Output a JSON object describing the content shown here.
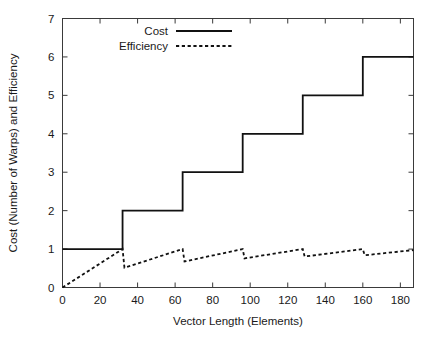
{
  "chart_data": {
    "type": "line",
    "title": "",
    "xlabel": "Vector Length (Elements)",
    "ylabel": "Cost (Number of Warps) and Efficiency",
    "xlim": [
      0,
      187
    ],
    "ylim": [
      0,
      7
    ],
    "xticks": [
      0,
      20,
      40,
      60,
      80,
      100,
      120,
      140,
      160,
      180
    ],
    "xticklabels": [
      "0",
      "20",
      "40",
      "60",
      "80",
      "100",
      "120",
      "140",
      "160",
      "180"
    ],
    "yticks": [
      0,
      1,
      2,
      3,
      4,
      5,
      6,
      7
    ],
    "yticklabels": [
      "0",
      "1",
      "2",
      "3",
      "4",
      "5",
      "6",
      "7"
    ],
    "grid": false,
    "legend_position": "top-center",
    "warp_size": 32,
    "series": [
      {
        "name": "Cost",
        "style": "solid",
        "color": "#111111",
        "description": "Step function: number of warps = ceil(vector length / 32)",
        "points": [
          [
            0,
            1
          ],
          [
            32,
            1
          ],
          [
            32,
            2
          ],
          [
            64,
            2
          ],
          [
            64,
            3
          ],
          [
            96,
            3
          ],
          [
            96,
            4
          ],
          [
            128,
            4
          ],
          [
            128,
            5
          ],
          [
            160,
            5
          ],
          [
            160,
            6
          ],
          [
            187,
            6
          ]
        ]
      },
      {
        "name": "Efficiency",
        "style": "dashed",
        "color": "#111111",
        "description": "Sawtooth: efficiency = vector length / (32 * ceil(vector length / 32))",
        "points": [
          [
            0,
            0.0
          ],
          [
            32,
            1.0
          ],
          [
            33,
            0.516
          ],
          [
            64,
            1.0
          ],
          [
            65,
            0.677
          ],
          [
            96,
            1.0
          ],
          [
            97,
            0.758
          ],
          [
            128,
            1.0
          ],
          [
            129,
            0.806
          ],
          [
            160,
            1.0
          ],
          [
            161,
            0.839
          ],
          [
            187,
            0.974
          ]
        ]
      }
    ],
    "legend_entries": [
      {
        "label": "Cost",
        "style": "solid"
      },
      {
        "label": "Efficiency",
        "style": "dashed"
      }
    ]
  }
}
